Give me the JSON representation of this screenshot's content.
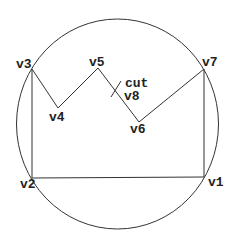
{
  "diagram": {
    "type": "polygon-in-circle",
    "circle": {
      "cx": 117.5,
      "cy": 124,
      "rx": 101,
      "ry": 105
    },
    "vertices": [
      {
        "id": "v1",
        "label": "v1",
        "x": 204,
        "y": 177,
        "lx": 208,
        "ly": 176
      },
      {
        "id": "v2",
        "label": "v2",
        "x": 32,
        "y": 178,
        "lx": 20,
        "ly": 178
      },
      {
        "id": "v3",
        "label": "v3",
        "x": 32,
        "y": 69,
        "lx": 16,
        "ly": 58
      },
      {
        "id": "v4",
        "label": "v4",
        "x": 58,
        "y": 108,
        "lx": 49,
        "ly": 111
      },
      {
        "id": "v5",
        "label": "v5",
        "x": 98,
        "y": 68,
        "lx": 89,
        "ly": 56
      },
      {
        "id": "v6",
        "label": "v6",
        "x": 139,
        "y": 122,
        "lx": 130,
        "ly": 123
      },
      {
        "id": "v7",
        "label": "v7",
        "x": 204,
        "y": 69,
        "lx": 202,
        "ly": 56
      }
    ],
    "edges": [
      [
        "v1",
        "v2"
      ],
      [
        "v2",
        "v3"
      ],
      [
        "v3",
        "v4"
      ],
      [
        "v4",
        "v5"
      ],
      [
        "v5",
        "v6"
      ],
      [
        "v6",
        "v7"
      ],
      [
        "v7",
        "v1"
      ]
    ],
    "cut": {
      "label": "cut",
      "x1": 111,
      "y1": 97,
      "x2": 121,
      "y2": 81,
      "lx": 125,
      "ly": 77
    },
    "cut_vertex": {
      "label": "v8",
      "lx": 124,
      "ly": 90
    },
    "stroke_color": "#333333"
  }
}
